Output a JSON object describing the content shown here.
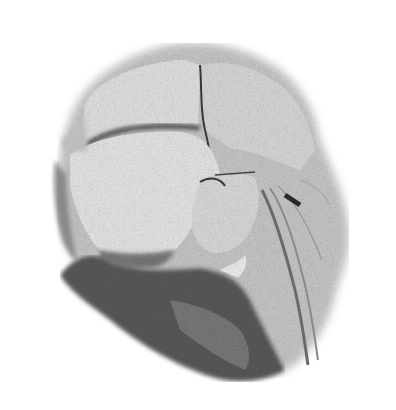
{
  "image": {
    "description": "Stippled grayscale anatomical illustration of a dissected head region",
    "width": 396,
    "height": 410,
    "palette": {
      "background": "#ffffff",
      "light": "#d8d8d8",
      "mid": "#9a9a9a",
      "dark": "#4a4a4a",
      "darkest": "#2a2a2a"
    }
  }
}
